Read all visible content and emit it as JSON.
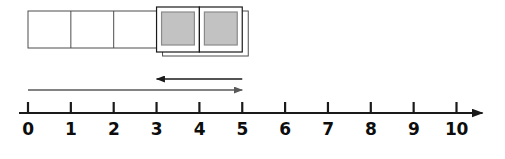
{
  "diagram": {
    "colors": {
      "stroke": "#1a1a1a",
      "block_stroke": "#4d4d4d",
      "shaded_fill": "#c2c2c2",
      "shaded_stroke": "#8a8a8a",
      "arrow_forward": "#595959",
      "arrow_back": "#1a1a1a",
      "background": "#ffffff"
    }
  },
  "number_line": {
    "min": 0,
    "max": 10,
    "step": 1,
    "tick_labels": [
      "0",
      "1",
      "2",
      "3",
      "4",
      "5",
      "6",
      "7",
      "8",
      "9",
      "10"
    ],
    "has_right_arrowhead": true,
    "axis_label": ""
  },
  "blocks": {
    "total": 5,
    "unshaded_count": 3,
    "shaded_count": 2,
    "items": [
      {
        "index": 0,
        "start": 0,
        "end": 1,
        "shaded": false
      },
      {
        "index": 1,
        "start": 1,
        "end": 2,
        "shaded": false
      },
      {
        "index": 2,
        "start": 2,
        "end": 3,
        "shaded": false
      },
      {
        "index": 3,
        "start": 3,
        "end": 4,
        "shaded": true
      },
      {
        "index": 4,
        "start": 4,
        "end": 5,
        "shaded": true
      }
    ]
  },
  "arrows": [
    {
      "id": "forward-jump",
      "label": "",
      "from": 0,
      "to": 5,
      "direction": "right",
      "row": "lower"
    },
    {
      "id": "backward-jump",
      "label": "",
      "from": 5,
      "to": 3,
      "direction": "left",
      "row": "upper"
    }
  ],
  "chart_data": {
    "type": "number-line",
    "title": "",
    "xlabel": "",
    "ylabel": "",
    "xlim": [
      0,
      10
    ],
    "categories": [
      "0",
      "1",
      "2",
      "3",
      "4",
      "5",
      "6",
      "7",
      "8",
      "9",
      "10"
    ],
    "values": [
      0,
      1,
      2,
      3,
      4,
      5,
      6,
      7,
      8,
      9,
      10
    ],
    "grid": false,
    "legend": "none",
    "annotations": [
      {
        "kind": "block-bar",
        "from": 0,
        "to": 3,
        "fill": "none",
        "note": "3 empty unit blocks"
      },
      {
        "kind": "block-bar",
        "from": 3,
        "to": 5,
        "fill": "shaded",
        "note": "2 shaded unit blocks"
      },
      {
        "kind": "arrow",
        "from": 0,
        "to": 5,
        "direction": "right"
      },
      {
        "kind": "arrow",
        "from": 5,
        "to": 3,
        "direction": "left"
      }
    ]
  }
}
